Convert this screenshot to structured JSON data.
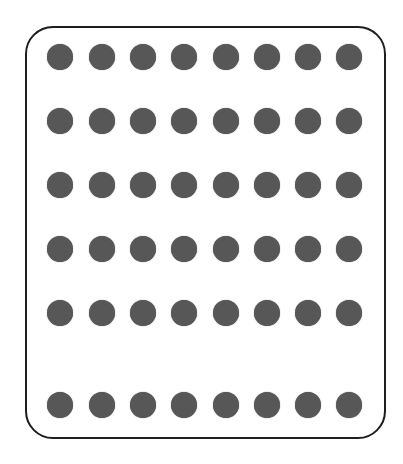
{
  "diagram": {
    "type": "dot-grid",
    "frame": {
      "shape": "rounded-rectangle",
      "border_color": "#1e1e1e"
    },
    "dot_color": "#575757",
    "columns": 8,
    "rows": 6,
    "column_centers_x": [
      60,
      102,
      143,
      184,
      226,
      267,
      308,
      349
    ],
    "row_centers_y": [
      57,
      121,
      185,
      249,
      313,
      405
    ],
    "dot_diameter": 26,
    "total_dots": 48
  }
}
